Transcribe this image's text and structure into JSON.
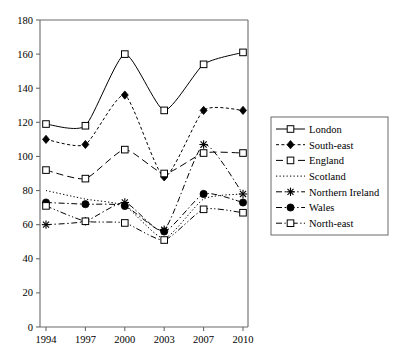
{
  "chart_data": {
    "type": "line",
    "title": "",
    "xlabel": "",
    "ylabel": "",
    "x": [
      1994,
      1997,
      2000,
      2003,
      2007,
      2010
    ],
    "xtick_labels": [
      "1994",
      "1997",
      "2000",
      "2003",
      "2007",
      "2010"
    ],
    "ytick_labels": [
      "0",
      "20",
      "40",
      "60",
      "80",
      "100",
      "120",
      "140",
      "160",
      "180"
    ],
    "yticks": [
      0,
      20,
      40,
      60,
      80,
      100,
      120,
      140,
      160,
      180
    ],
    "ylim": [
      0,
      180
    ],
    "grid": false,
    "legend_position": "right",
    "series": [
      {
        "name": "London",
        "marker": "open-square",
        "line": "solid",
        "color": "#000000",
        "values": [
          119,
          118,
          160,
          127,
          154,
          161
        ]
      },
      {
        "name": "South-east",
        "marker": "filled-diamond",
        "line": "short-dash",
        "color": "#000000",
        "values": [
          110,
          107,
          136,
          88,
          127,
          127
        ]
      },
      {
        "name": "England",
        "marker": "open-square",
        "line": "long-dash",
        "color": "#000000",
        "values": [
          92,
          87,
          104,
          90,
          102,
          102
        ]
      },
      {
        "name": "Scotland",
        "marker": "none",
        "line": "dotted",
        "color": "#000000",
        "values": [
          80,
          75,
          71,
          52,
          75,
          78
        ]
      },
      {
        "name": "Northern Ireland",
        "marker": "cross-star",
        "line": "dash-dot",
        "color": "#000000",
        "values": [
          60,
          62,
          73,
          57,
          107,
          78
        ]
      },
      {
        "name": "Wales",
        "marker": "filled-circle",
        "line": "dash-dot",
        "color": "#000000",
        "values": [
          73,
          72,
          71,
          56,
          78,
          73
        ]
      },
      {
        "name": "North-east",
        "marker": "open-square",
        "line": "dash-dot-dot",
        "color": "#000000",
        "values": [
          71,
          62,
          61,
          51,
          69,
          67
        ]
      }
    ]
  },
  "legend": {
    "items": [
      {
        "label": "London"
      },
      {
        "label": "South-east"
      },
      {
        "label": "England"
      },
      {
        "label": "Scotland"
      },
      {
        "label": "Northern Ireland"
      },
      {
        "label": "Wales"
      },
      {
        "label": "North-east"
      }
    ]
  },
  "colors": {
    "ink": "#000000",
    "axis": "#555555",
    "background": "#ffffff"
  }
}
